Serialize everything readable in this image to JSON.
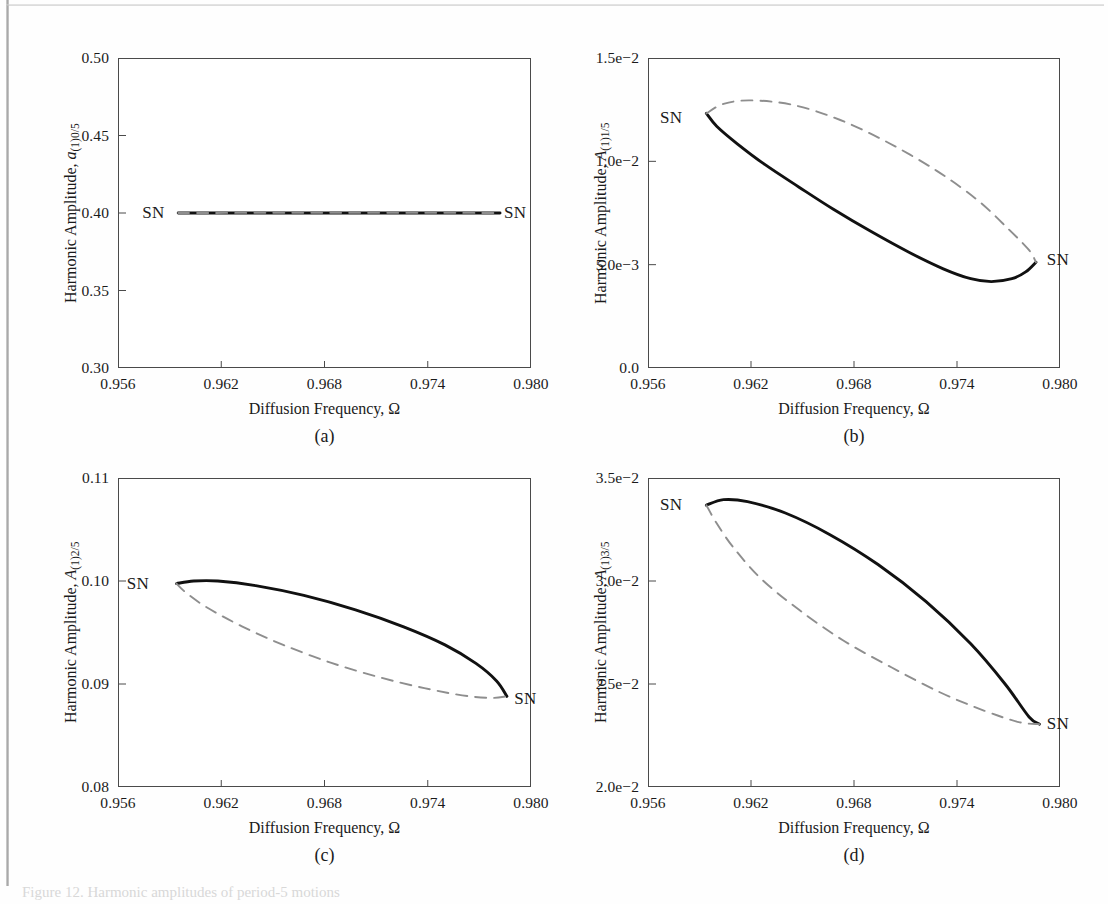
{
  "figure": {
    "width": 1108,
    "height": 904,
    "background": "#fefefe",
    "solid_color": "#111111",
    "dashed_color": "#8e8e8e",
    "axis_color": "#4a4a4a",
    "caption_partial": "Figure 12. Harmonic amplitudes of period-5 motions"
  },
  "chart_data": [
    {
      "id": "a",
      "type": "line",
      "panel_label": "(a)",
      "title": "",
      "xlabel": "Diffusion Frequency, Ω",
      "ylabel": "Harmonic Amplitude, a(1)0/5",
      "ylabel_parts": {
        "prefix": "Harmonic Amplitude, ",
        "symbol": "a",
        "subscript": "(1)0/5"
      },
      "xlim": [
        0.956,
        0.98
      ],
      "ylim": [
        0.3,
        0.5
      ],
      "xticks": [
        "0.956",
        "0.962",
        "0.968",
        "0.974",
        "0.980"
      ],
      "xtick_values": [
        0.956,
        0.962,
        0.968,
        0.974,
        0.98
      ],
      "yticks": [
        "0.30",
        "0.35",
        "0.40",
        "0.45",
        "0.50"
      ],
      "ytick_values": [
        0.3,
        0.35,
        0.4,
        0.45,
        0.5
      ],
      "grid": false,
      "legend": "none",
      "annotations": [
        {
          "text": "SN",
          "x": 0.9595,
          "y": 0.4,
          "align": "right"
        },
        {
          "text": "SN",
          "x": 0.9782,
          "y": 0.4,
          "align": "left"
        }
      ],
      "series": [
        {
          "name": "stable (solid)",
          "style": "solid",
          "points": [
            [
              0.9595,
              0.4
            ],
            [
              0.965,
              0.4
            ],
            [
              0.97,
              0.4
            ],
            [
              0.975,
              0.4
            ],
            [
              0.9782,
              0.4
            ]
          ]
        },
        {
          "name": "unstable (dashed)",
          "style": "dashed",
          "points": [
            [
              0.9595,
              0.4
            ],
            [
              0.965,
              0.4001
            ],
            [
              0.97,
              0.4001
            ],
            [
              0.975,
              0.4001
            ],
            [
              0.9782,
              0.4
            ]
          ]
        }
      ]
    },
    {
      "id": "b",
      "type": "line",
      "panel_label": "(b)",
      "title": "",
      "xlabel": "Diffusion Frequency, Ω",
      "ylabel": "Harmonic Amplitude, A(1)1/5",
      "ylabel_parts": {
        "prefix": "Harmonic Amplitude, ",
        "symbol": "A",
        "subscript": "(1)1/5"
      },
      "xlim": [
        0.956,
        0.98
      ],
      "ylim": [
        0.0,
        0.015
      ],
      "xticks": [
        "0.956",
        "0.962",
        "0.968",
        "0.974",
        "0.980"
      ],
      "xtick_values": [
        0.956,
        0.962,
        0.968,
        0.974,
        0.98
      ],
      "yticks": [
        "0.0",
        "5.0e−3",
        "1.0e−2",
        "1.5e−2"
      ],
      "ytick_values": [
        0.0,
        0.005,
        0.01,
        0.015
      ],
      "grid": false,
      "legend": "none",
      "annotations": [
        {
          "text": "SN",
          "x": 0.9588,
          "y": 0.01212,
          "align": "right"
        },
        {
          "text": "SN",
          "x": 0.979,
          "y": 0.00522,
          "align": "left"
        }
      ],
      "series": [
        {
          "name": "stable (solid)",
          "style": "solid",
          "points": [
            [
              0.9594,
              0.01232
            ],
            [
              0.96,
              0.0117
            ],
            [
              0.9612,
              0.01085
            ],
            [
              0.9628,
              0.00985
            ],
            [
              0.9648,
              0.00875
            ],
            [
              0.9668,
              0.00768
            ],
            [
              0.969,
              0.0066
            ],
            [
              0.9712,
              0.0056
            ],
            [
              0.9732,
              0.0048
            ],
            [
              0.9748,
              0.00432
            ],
            [
              0.976,
              0.00418
            ],
            [
              0.9772,
              0.00432
            ],
            [
              0.978,
              0.00465
            ],
            [
              0.9786,
              0.00512
            ]
          ]
        },
        {
          "name": "unstable (dashed)",
          "style": "dashed",
          "points": [
            [
              0.9594,
              0.01232
            ],
            [
              0.9604,
              0.01278
            ],
            [
              0.962,
              0.01295
            ],
            [
              0.9645,
              0.01272
            ],
            [
              0.9672,
              0.012
            ],
            [
              0.97,
              0.0109
            ],
            [
              0.9728,
              0.00955
            ],
            [
              0.9752,
              0.00812
            ],
            [
              0.977,
              0.00672
            ],
            [
              0.9782,
              0.0057
            ],
            [
              0.9786,
              0.00512
            ]
          ]
        }
      ]
    },
    {
      "id": "c",
      "type": "line",
      "panel_label": "(c)",
      "title": "",
      "xlabel": "Diffusion Frequency, Ω",
      "ylabel": "Harmonic Amplitude, A(1)2/5",
      "ylabel_parts": {
        "prefix": "Harmonic Amplitude, ",
        "symbol": "A",
        "subscript": "(1)2/5"
      },
      "xlim": [
        0.956,
        0.98
      ],
      "ylim": [
        0.08,
        0.11
      ],
      "xticks": [
        "0.956",
        "0.962",
        "0.968",
        "0.974",
        "0.980"
      ],
      "xtick_values": [
        0.956,
        0.962,
        0.968,
        0.974,
        0.98
      ],
      "yticks": [
        "0.08",
        "0.09",
        "0.10",
        "0.11"
      ],
      "ytick_values": [
        0.08,
        0.09,
        0.1,
        0.11
      ],
      "grid": false,
      "legend": "none",
      "annotations": [
        {
          "text": "SN",
          "x": 0.9586,
          "y": 0.0997,
          "align": "right"
        },
        {
          "text": "SN",
          "x": 0.9788,
          "y": 0.0885,
          "align": "left"
        }
      ],
      "series": [
        {
          "name": "stable (solid)",
          "style": "solid",
          "points": [
            [
              0.9594,
              0.09975
            ],
            [
              0.9604,
              0.1
            ],
            [
              0.9618,
              0.1
            ],
            [
              0.964,
              0.09955
            ],
            [
              0.9668,
              0.0986
            ],
            [
              0.9698,
              0.0972
            ],
            [
              0.9726,
              0.09555
            ],
            [
              0.975,
              0.0938
            ],
            [
              0.9768,
              0.092
            ],
            [
              0.978,
              0.0903
            ],
            [
              0.9786,
              0.0888
            ]
          ]
        },
        {
          "name": "unstable (dashed)",
          "style": "dashed",
          "points": [
            [
              0.9594,
              0.09975
            ],
            [
              0.96,
              0.0988
            ],
            [
              0.9612,
              0.0974
            ],
            [
              0.9632,
              0.0956
            ],
            [
              0.9656,
              0.0938
            ],
            [
              0.9684,
              0.09205
            ],
            [
              0.9712,
              0.09065
            ],
            [
              0.9738,
              0.0896
            ],
            [
              0.976,
              0.0889
            ],
            [
              0.9776,
              0.08865
            ],
            [
              0.9786,
              0.0888
            ]
          ]
        }
      ]
    },
    {
      "id": "d",
      "type": "line",
      "panel_label": "(d)",
      "title": "",
      "xlabel": "Diffusion Frequency, Ω",
      "ylabel": "Harmonic Amplitude, A(1)3/5",
      "ylabel_parts": {
        "prefix": "Harmonic Amplitude, ",
        "symbol": "A",
        "subscript": "(1)3/5"
      },
      "xlim": [
        0.956,
        0.98
      ],
      "ylim": [
        0.02,
        0.035
      ],
      "xticks": [
        "0.956",
        "0.962",
        "0.968",
        "0.974",
        "0.980"
      ],
      "xtick_values": [
        0.956,
        0.962,
        0.968,
        0.974,
        0.98
      ],
      "yticks": [
        "2.0e−2",
        "2.5e−2",
        "3.0e−2",
        "3.5e−2"
      ],
      "ytick_values": [
        0.02,
        0.025,
        0.03,
        0.035
      ],
      "grid": false,
      "legend": "none",
      "annotations": [
        {
          "text": "SN",
          "x": 0.9588,
          "y": 0.0337,
          "align": "right"
        },
        {
          "text": "SN",
          "x": 0.979,
          "y": 0.02305,
          "align": "left"
        }
      ],
      "series": [
        {
          "name": "stable (solid)",
          "style": "solid",
          "points": [
            [
              0.9594,
              0.03368
            ],
            [
              0.9604,
              0.03395
            ],
            [
              0.9618,
              0.03385
            ],
            [
              0.964,
              0.0333
            ],
            [
              0.9666,
              0.03225
            ],
            [
              0.9694,
              0.0308
            ],
            [
              0.9722,
              0.029
            ],
            [
              0.9748,
              0.02695
            ],
            [
              0.9768,
              0.025
            ],
            [
              0.9782,
              0.0234
            ],
            [
              0.9788,
              0.02305
            ]
          ]
        },
        {
          "name": "unstable (dashed)",
          "style": "dashed",
          "points": [
            [
              0.9594,
              0.03368
            ],
            [
              0.96,
              0.0328
            ],
            [
              0.961,
              0.0316
            ],
            [
              0.9626,
              0.0301
            ],
            [
              0.9648,
              0.0286
            ],
            [
              0.9674,
              0.0271
            ],
            [
              0.9702,
              0.0258
            ],
            [
              0.973,
              0.0246
            ],
            [
              0.9756,
              0.0237
            ],
            [
              0.9776,
              0.02315
            ],
            [
              0.9788,
              0.02305
            ]
          ]
        }
      ]
    }
  ]
}
